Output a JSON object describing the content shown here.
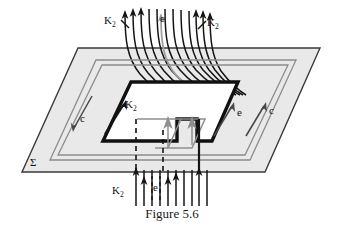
{
  "figure": {
    "caption": "Figure 5.6",
    "plane_label": "Σ",
    "labels": {
      "k2": "K",
      "k2_sub": "2",
      "e": "e",
      "c": "c"
    },
    "annotations": [
      {
        "id": "top-left-k2",
        "text": "K",
        "sub": "2",
        "x": 112,
        "y": 22
      },
      {
        "id": "top-middle-e",
        "text": "e",
        "sub": "",
        "x": 163,
        "y": 20
      },
      {
        "id": "top-right-k2",
        "text": "K",
        "sub": "2",
        "x": 198,
        "y": 24
      },
      {
        "id": "left-plane-c",
        "text": "c",
        "sub": "",
        "x": 82,
        "y": 118
      },
      {
        "id": "inner-left-k2",
        "text": "K",
        "sub": "2",
        "x": 117,
        "y": 110
      },
      {
        "id": "right-inner-e",
        "text": "e",
        "sub": "",
        "x": 240,
        "y": 116
      },
      {
        "id": "right-plane-c",
        "text": "c",
        "sub": "",
        "x": 272,
        "y": 114
      },
      {
        "id": "bottom-left-k2",
        "text": "K",
        "sub": "2",
        "x": 117,
        "y": 194
      },
      {
        "id": "bottom-middle-e",
        "text": "e",
        "sub": "",
        "x": 156,
        "y": 192
      }
    ],
    "colors": {
      "plane_fill": "#e9e9e9",
      "plane_stroke": "#3a3a3a",
      "band_stroke": "#8c8c8c",
      "curve_stroke": "#111111",
      "flux_stroke": "#141414",
      "accent_gray": "#9a9a9a",
      "background": "#ffffff"
    },
    "geometry": {
      "outer_plane": "78,48 320,48 265,172 22,172",
      "inner_band_outer": "96,60 296,60 250,160 50,160",
      "inner_band_inner": "101,64 290,64 246,156 56,156",
      "flux_top_count": 13,
      "flux_bottom_count": 12
    }
  }
}
